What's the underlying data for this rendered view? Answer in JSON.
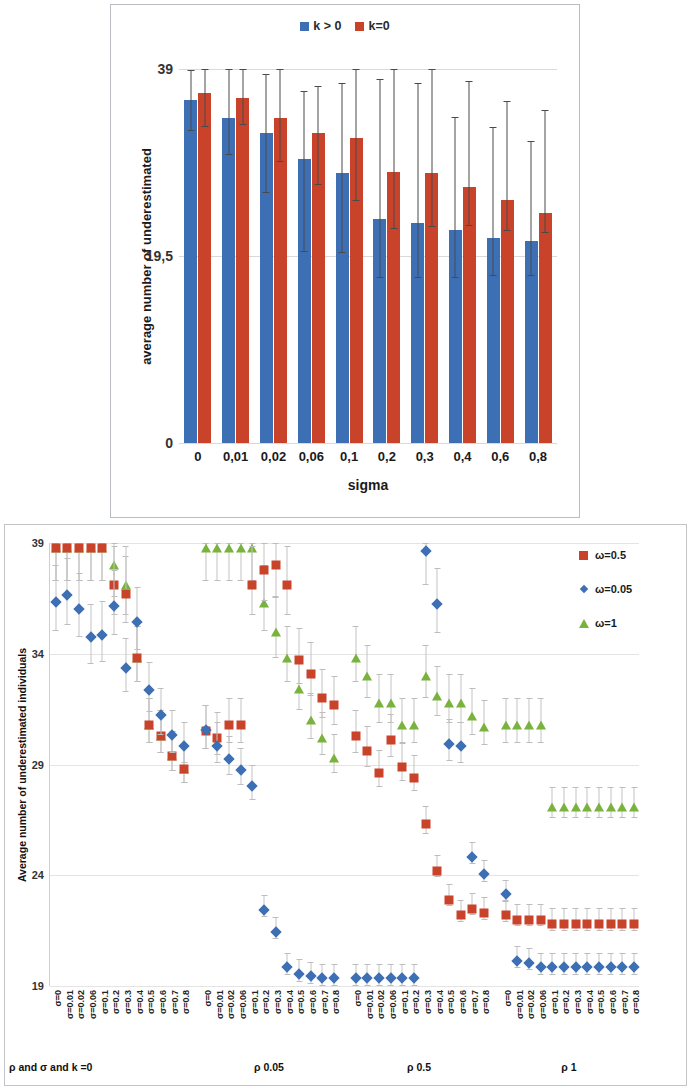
{
  "colors": {
    "blue": "#3d6fb4",
    "red": "#c9432a",
    "green": "#79b23c",
    "grid": "#d9d9d9",
    "error_bar": "#c4c4c4",
    "panel_border": "#b9bcc0"
  },
  "top_chart": {
    "legend": [
      {
        "label": "k > 0",
        "color_key": "blue"
      },
      {
        "label": "k=0",
        "color_key": "red"
      }
    ],
    "ylabel": "average number of underestimated",
    "xlabel": "sigma",
    "yticks": [
      "39",
      "19,5",
      "0"
    ],
    "xticks": [
      "0",
      "0,01",
      "0,02",
      "0,06",
      "0,1",
      "0,2",
      "0,3",
      "0,4",
      "0,6",
      "0,8"
    ]
  },
  "bottom_chart": {
    "ylabel": "Average number of underestimated individuals",
    "yticks": [
      "39",
      "34",
      "29",
      "24",
      "19"
    ],
    "legend": [
      {
        "label": "ω=0.5",
        "marker": "square",
        "color_key": "red"
      },
      {
        "label": "ω=0.05",
        "marker": "diamond",
        "color_key": "blue"
      },
      {
        "label": "ω=1",
        "marker": "triangle",
        "color_key": "green"
      }
    ],
    "group_labels": [
      "ρ and σ and k =0",
      "ρ 0.05",
      "ρ 0.5",
      "ρ 1"
    ],
    "sigma_labels": [
      "σ=0",
      "σ=0.01",
      "σ=0.02",
      "σ=0.06",
      "σ=0.1",
      "σ=0.2",
      "σ=0.3",
      "σ=0.4",
      "σ=0.5",
      "σ=0.6",
      "σ=0.7",
      "σ=0.8"
    ]
  },
  "chart_data": [
    {
      "type": "bar",
      "title": "",
      "xlabel": "sigma",
      "ylabel": "average number of underestimated",
      "categories": [
        "0",
        "0,01",
        "0,02",
        "0,06",
        "0,1",
        "0,2",
        "0,3",
        "0,4",
        "0,6",
        "0,8"
      ],
      "ylim": [
        0,
        39
      ],
      "yticks": [
        0,
        19.5,
        39
      ],
      "grid": true,
      "legend_position": "top-center",
      "series": [
        {
          "name": "k > 0",
          "color": "#3d6fb4",
          "values": [
            35.8,
            33.9,
            32.3,
            29.6,
            28.2,
            23.4,
            22.9,
            22.2,
            21.4,
            21.1
          ],
          "err_low": [
            32.5,
            30.0,
            26.1,
            19.9,
            19.8,
            17.2,
            17.2,
            17.2,
            17.4,
            17.4
          ],
          "err_high": [
            38.9,
            39.0,
            38.5,
            36.7,
            37.5,
            38.0,
            37.5,
            34.0,
            33.0,
            31.5
          ]
        },
        {
          "name": "k=0",
          "color": "#c9432a",
          "values": [
            36.5,
            36.0,
            33.9,
            32.3,
            31.8,
            28.3,
            28.2,
            26.7,
            25.3,
            24.0
          ],
          "err_low": [
            32.9,
            33.2,
            29.3,
            26.9,
            25.2,
            22.3,
            22.5,
            22.6,
            22.1,
            21.9
          ],
          "err_high": [
            39.0,
            39.0,
            39.0,
            37.2,
            39.0,
            39.0,
            39.0,
            37.8,
            35.7,
            34.7
          ]
        }
      ]
    },
    {
      "type": "scatter",
      "title": "",
      "xlabel": "",
      "ylabel": "Average number of underestimated individuals",
      "ylim": [
        19,
        39
      ],
      "yticks": [
        19,
        24,
        29,
        34,
        39
      ],
      "grid": true,
      "legend_position": "right-top",
      "x_groups": [
        {
          "label": "ρ and σ and k =0",
          "sigmas": [
            "σ=0",
            "σ=0.01",
            "σ=0.02",
            "σ=0.06",
            "σ=0.1",
            "σ=0.2",
            "σ=0.3",
            "σ=0.4",
            "σ=0.5",
            "σ=0.6",
            "σ=0.7",
            "σ=0.8"
          ]
        },
        {
          "label": "ρ 0.05",
          "sigmas": [
            "σ=0",
            "σ=0.01",
            "σ=0.02",
            "σ=0.06",
            "σ=0.1",
            "σ=0.2",
            "σ=0.3",
            "σ=0.4",
            "σ=0.5",
            "σ=0.6",
            "σ=0.7",
            "σ=0.8"
          ]
        },
        {
          "label": "ρ 0.5",
          "sigmas": [
            "σ=0",
            "σ=0.01",
            "σ=0.02",
            "σ=0.06",
            "σ=0.1",
            "σ=0.2",
            "σ=0.3",
            "σ=0.4",
            "σ=0.5",
            "σ=0.6",
            "σ=0.7",
            "σ=0.8"
          ]
        },
        {
          "label": "ρ 1",
          "sigmas": [
            "σ=0",
            "σ=0.01",
            "σ=0.02",
            "σ=0.06",
            "σ=0.1",
            "σ=0.2",
            "σ=0.3",
            "σ=0.4",
            "σ=0.5",
            "σ=0.6",
            "σ=0.7",
            "σ=0.8"
          ]
        }
      ],
      "series": [
        {
          "name": "ω=0.5",
          "marker": "square",
          "color": "#c9432a",
          "values": [
            39,
            39,
            39,
            39,
            39,
            37.3,
            36.9,
            34.0,
            31.0,
            30.5,
            29.6,
            29.0,
            30.7,
            30.4,
            31.0,
            31.0,
            37.3,
            38.0,
            38.2,
            37.3,
            33.9,
            33.3,
            32.2,
            31.9,
            30.5,
            29.8,
            28.8,
            30.3,
            29.1,
            28.6,
            26.5,
            24.4,
            23.1,
            22.4,
            22.7,
            22.5,
            22.4,
            22.2,
            22.2,
            22.2,
            22.0,
            22.0,
            22.0,
            22.0,
            22.0,
            22.0,
            22.0,
            22.0
          ]
        },
        {
          "name": "ω=0.05",
          "marker": "diamond",
          "color": "#3d6fb4",
          "values": [
            36.5,
            36.8,
            36.2,
            34.9,
            35.0,
            36.3,
            33.5,
            35.6,
            32.5,
            31.4,
            30.5,
            30.0,
            30.7,
            30.0,
            29.4,
            28.9,
            28.2,
            22.6,
            21.6,
            20.0,
            19.7,
            19.6,
            19.5,
            19.5,
            19.5,
            19.5,
            19.5,
            19.5,
            19.5,
            19.5,
            38.8,
            36.4,
            30.1,
            30.0,
            25.0,
            24.2,
            23.3,
            20.3,
            20.2,
            20.0,
            20.0,
            20.0,
            20.0,
            20.0,
            20.0,
            20.0,
            20.0,
            20.0
          ]
        },
        {
          "name": "ω=1",
          "marker": "triangle",
          "color": "#79b23c",
          "values": [
            39,
            39,
            39,
            39,
            39,
            38.2,
            37.3,
            34.0,
            31.0,
            30.5,
            29.6,
            29.0,
            39,
            39,
            39,
            39,
            39,
            36.5,
            35.2,
            34.0,
            32.6,
            31.2,
            30.4,
            29.5,
            34.0,
            33.2,
            32.0,
            32.0,
            31.0,
            31.0,
            33.2,
            32.3,
            32.0,
            32.0,
            31.4,
            30.9,
            31.0,
            31.0,
            31.0,
            31.0,
            27.3,
            27.3,
            27.3,
            27.3,
            27.3,
            27.3,
            27.3,
            27.3
          ]
        }
      ]
    }
  ]
}
